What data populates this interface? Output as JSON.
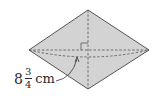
{
  "diagram": {
    "shape": "rhombus",
    "fill_color": "#d3d3d3",
    "stroke_color": "#555555",
    "vertices": {
      "top": [
        88,
        10
      ],
      "left": [
        29,
        50
      ],
      "right": [
        149,
        50
      ],
      "bottom": [
        88,
        89
      ]
    },
    "diagonals": {
      "style": "dashed",
      "horizontal": {
        "from": [
          29,
          50
        ],
        "to": [
          149,
          50
        ]
      },
      "vertical": {
        "from": [
          88,
          10
        ],
        "to": [
          88,
          89
        ]
      }
    },
    "right_angle_marker": true,
    "measurement_arc": {
      "style": "dashed",
      "from": [
        29,
        50
      ],
      "to": [
        149,
        50
      ],
      "sag_y": 57
    },
    "label": {
      "whole": "8",
      "numerator": "3",
      "denominator": "4",
      "unit": "cm",
      "refers_to": "horizontal diagonal"
    }
  }
}
